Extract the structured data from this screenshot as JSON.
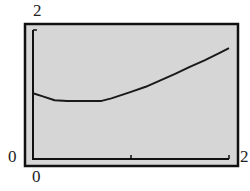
{
  "chart_data": {
    "type": "line",
    "title": "",
    "xlabel": "",
    "ylabel": "",
    "xlim": [
      0,
      2
    ],
    "ylim": [
      0,
      2
    ],
    "grid": false,
    "legend": null,
    "tick_labels": {
      "x_min": "0",
      "x_max": "2",
      "y_min": "0",
      "y_max": "2"
    },
    "x_ticks": [
      1
    ],
    "series": [
      {
        "name": "f(x)",
        "x": [
          0,
          0.1,
          0.22,
          0.35,
          0.5,
          0.7,
          0.8,
          1.0,
          1.15,
          1.3,
          1.45,
          1.6,
          1.75,
          1.9,
          2.0
        ],
        "y": [
          1.02,
          0.97,
          0.91,
          0.9,
          0.9,
          0.9,
          0.94,
          1.04,
          1.12,
          1.22,
          1.32,
          1.43,
          1.53,
          1.64,
          1.72
        ]
      }
    ],
    "colors": {
      "background": "#d6d6d6",
      "line": "#1a1a1a",
      "frame": "#111111"
    }
  }
}
